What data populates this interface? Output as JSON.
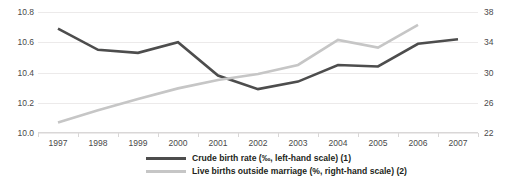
{
  "chart_data": {
    "type": "line",
    "title": "",
    "xlabel": "",
    "grid": true,
    "legend_position": "bottom",
    "x": [
      "1997",
      "1998",
      "1999",
      "2000",
      "2001",
      "2002",
      "2003",
      "2004",
      "2005",
      "2006",
      "2007"
    ],
    "axes": {
      "left": {
        "label": "Crude birth rate (‰, left-hand scale) (1)",
        "ticks": [
          "10.0",
          "10.2",
          "10.4",
          "10.6",
          "10.8"
        ],
        "tick_values": [
          10.0,
          10.2,
          10.4,
          10.6,
          10.8
        ],
        "ylim": [
          10.0,
          10.8
        ]
      },
      "right": {
        "label": "Live births outside marriage (%, right-hand scale) (2)",
        "ticks": [
          "22",
          "26",
          "30",
          "34",
          "38"
        ],
        "tick_values": [
          22,
          26,
          30,
          34,
          38
        ],
        "ylim": [
          22,
          38
        ]
      }
    },
    "series": [
      {
        "name": "Crude birth rate (‰, left-hand scale) (1)",
        "axis": "left",
        "color": "#4d4d4d",
        "x": [
          "1997",
          "1998",
          "1999",
          "2000",
          "2001",
          "2002",
          "2003",
          "2004",
          "2005",
          "2006",
          "2007"
        ],
        "values": [
          10.69,
          10.55,
          10.53,
          10.6,
          10.38,
          10.29,
          10.34,
          10.45,
          10.44,
          10.59,
          10.62
        ]
      },
      {
        "name": "Live births outside marriage (%, right-hand scale) (2)",
        "axis": "right",
        "color": "#c6c6c6",
        "x": [
          "1997",
          "1998",
          "1999",
          "2000",
          "2001",
          "2002",
          "2003",
          "2004",
          "2005",
          "2006"
        ],
        "values": [
          23.4,
          25.0,
          26.5,
          27.9,
          29.0,
          29.8,
          31.0,
          34.3,
          33.3,
          36.3
        ]
      }
    ]
  },
  "legend": {
    "items": [
      {
        "label": "Crude birth rate (‰, left-hand scale) (1)",
        "color": "#4d4d4d"
      },
      {
        "label": "Live births outside marriage (%, right-hand scale) (2)",
        "color": "#c6c6c6"
      }
    ]
  }
}
